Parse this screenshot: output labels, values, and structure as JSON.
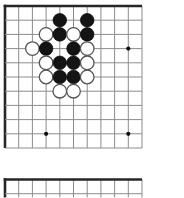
{
  "diagram": {
    "kind": "go-problem-diagram",
    "background": "#ffffff",
    "line_color": "#8c8c8c",
    "edge_color": "#262626",
    "star_color": "#111111",
    "stone_black_fill": "#141414",
    "stone_black_stroke": "#000000",
    "stone_white_fill": "#ffffff",
    "stone_white_stroke": "#555555",
    "stone_radius": 6.8,
    "star_radius": 2.1,
    "line_width": 1,
    "edge_width": 2.6
  },
  "boards": [
    {
      "name": "go-board-top",
      "x": 5,
      "y": 6,
      "cell_x": 13.7,
      "cell_y": 14.2,
      "cols": 11,
      "rows": 11,
      "thick_top": true,
      "thick_left": true,
      "v_extent": null,
      "star_points": [
        {
          "col": 9,
          "row": 3
        },
        {
          "col": 3,
          "row": 9
        },
        {
          "col": 9,
          "row": 9
        }
      ],
      "stones": [
        {
          "col": 4,
          "row": 1,
          "color": "black"
        },
        {
          "col": 6,
          "row": 1,
          "color": "black"
        },
        {
          "col": 3,
          "row": 2,
          "color": "white"
        },
        {
          "col": 4,
          "row": 2,
          "color": "black"
        },
        {
          "col": 5,
          "row": 2,
          "color": "white"
        },
        {
          "col": 6,
          "row": 2,
          "color": "black"
        },
        {
          "col": 2,
          "row": 3,
          "color": "white"
        },
        {
          "col": 3,
          "row": 3,
          "color": "black"
        },
        {
          "col": 5,
          "row": 3,
          "color": "black"
        },
        {
          "col": 6,
          "row": 3,
          "color": "white"
        },
        {
          "col": 3,
          "row": 4,
          "color": "white"
        },
        {
          "col": 4,
          "row": 4,
          "color": "black"
        },
        {
          "col": 5,
          "row": 4,
          "color": "black"
        },
        {
          "col": 6,
          "row": 4,
          "color": "white"
        },
        {
          "col": 3,
          "row": 5,
          "color": "white"
        },
        {
          "col": 4,
          "row": 5,
          "color": "black"
        },
        {
          "col": 5,
          "row": 5,
          "color": "black"
        },
        {
          "col": 6,
          "row": 5,
          "color": "white"
        },
        {
          "col": 4,
          "row": 6,
          "color": "white"
        },
        {
          "col": 5,
          "row": 6,
          "color": "white"
        }
      ]
    },
    {
      "name": "go-board-bottom-partial",
      "x": 5,
      "y": 179.5,
      "cell_x": 13.7,
      "cell_y": 14.2,
      "cols": 11,
      "rows": 2,
      "thick_top": true,
      "thick_left": true,
      "v_extent": 18,
      "star_points": [],
      "stones": []
    }
  ]
}
